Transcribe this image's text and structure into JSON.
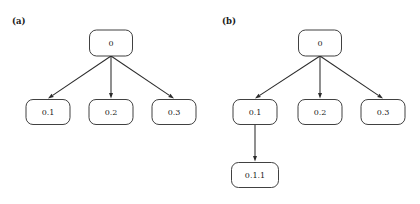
{
  "figure": {
    "background_color": "#ffffff",
    "stroke_color": "#2b2b2b",
    "node_fill_color": "#ffffff",
    "text_color": "#1a1a1a",
    "width": 420,
    "height": 204
  },
  "panels": [
    {
      "id": "a",
      "label": "(a)",
      "nodes": [
        {
          "id": "a-root",
          "label": "0",
          "cx": 111,
          "cy": 43,
          "w": 43,
          "h": 26
        },
        {
          "id": "a-c1",
          "label": "0.1",
          "cx": 48,
          "cy": 112,
          "w": 44,
          "h": 25
        },
        {
          "id": "a-c2",
          "label": "0.2",
          "cx": 111,
          "cy": 112,
          "w": 44,
          "h": 25
        },
        {
          "id": "a-c3",
          "label": "0.3",
          "cx": 174,
          "cy": 112,
          "w": 44,
          "h": 25
        }
      ],
      "edges": [
        {
          "id": "a-e1",
          "from": "a-root",
          "to": "a-c1"
        },
        {
          "id": "a-e2",
          "from": "a-root",
          "to": "a-c2"
        },
        {
          "id": "a-e3",
          "from": "a-root",
          "to": "a-c3"
        }
      ]
    },
    {
      "id": "b",
      "label": "(b)",
      "nodes": [
        {
          "id": "b-root",
          "label": "0",
          "cx": 320,
          "cy": 43,
          "w": 43,
          "h": 26
        },
        {
          "id": "b-c1",
          "label": "0.1",
          "cx": 255,
          "cy": 112,
          "w": 44,
          "h": 25
        },
        {
          "id": "b-c2",
          "label": "0.2",
          "cx": 320,
          "cy": 112,
          "w": 44,
          "h": 25
        },
        {
          "id": "b-c3",
          "label": "0.3",
          "cx": 383,
          "cy": 112,
          "w": 44,
          "h": 25
        },
        {
          "id": "b-g1",
          "label": "0.1.1",
          "cx": 255,
          "cy": 175,
          "w": 47,
          "h": 25
        }
      ],
      "edges": [
        {
          "id": "b-e1",
          "from": "b-root",
          "to": "b-c1"
        },
        {
          "id": "b-e2",
          "from": "b-root",
          "to": "b-c2"
        },
        {
          "id": "b-e3",
          "from": "b-root",
          "to": "b-c3"
        },
        {
          "id": "b-e4",
          "from": "b-c1",
          "to": "b-g1"
        }
      ]
    }
  ],
  "panel_label_positions": [
    {
      "id": "a",
      "x": 12,
      "y": 24
    },
    {
      "id": "b",
      "x": 222,
      "y": 24
    }
  ]
}
